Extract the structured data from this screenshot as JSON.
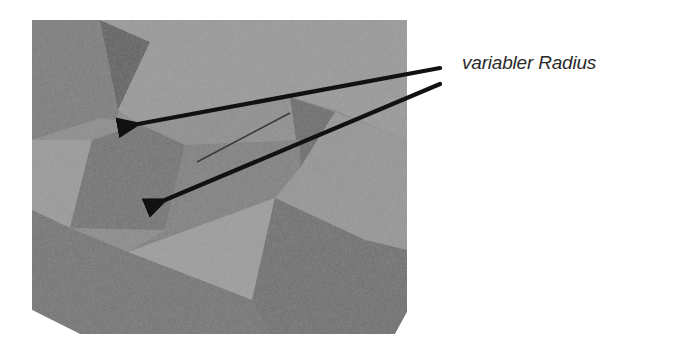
{
  "figure": {
    "type": "3d-render-annotated",
    "background": "#ffffff",
    "render_region": {
      "outline": [
        [
          32,
          20
        ],
        [
          407,
          20
        ],
        [
          407,
          312
        ],
        [
          395,
          334
        ],
        [
          80,
          334
        ],
        [
          32,
          310
        ]
      ],
      "base_color": "#8a8a8a"
    },
    "faces": [
      {
        "name": "top-left-box-face",
        "points": [
          [
            32,
            20
          ],
          [
            100,
            20
          ],
          [
            150,
            42
          ],
          [
            115,
            120
          ],
          [
            32,
            140
          ]
        ],
        "color": "#7c7c7c"
      },
      {
        "name": "top-left-dark-triangle",
        "points": [
          [
            100,
            20
          ],
          [
            150,
            42
          ],
          [
            118,
            110
          ]
        ],
        "color": "#5f5f5f"
      },
      {
        "name": "top-right-light-region",
        "points": [
          [
            100,
            20
          ],
          [
            407,
            20
          ],
          [
            407,
            140
          ],
          [
            335,
            110
          ],
          [
            290,
            97
          ],
          [
            140,
            124
          ],
          [
            118,
            110
          ],
          [
            150,
            42
          ]
        ],
        "color": "#999999"
      },
      {
        "name": "left-light-face",
        "points": [
          [
            32,
            140
          ],
          [
            92,
            140
          ],
          [
            70,
            228
          ],
          [
            32,
            210
          ]
        ],
        "color": "#9a9a9a"
      },
      {
        "name": "left-mid-face",
        "points": [
          [
            32,
            140
          ],
          [
            100,
            118
          ],
          [
            140,
            124
          ],
          [
            92,
            140
          ]
        ],
        "color": "#8c8c8c"
      },
      {
        "name": "center-dark-box-front",
        "points": [
          [
            92,
            140
          ],
          [
            140,
            124
          ],
          [
            185,
            145
          ],
          [
            165,
            230
          ],
          [
            70,
            228
          ]
        ],
        "color": "#727272"
      },
      {
        "name": "center-box-top",
        "points": [
          [
            140,
            124
          ],
          [
            290,
            97
          ],
          [
            300,
            140
          ],
          [
            185,
            145
          ]
        ],
        "color": "#8e8e8e"
      },
      {
        "name": "right-small-dark-triangle",
        "points": [
          [
            290,
            97
          ],
          [
            335,
            112
          ],
          [
            300,
            168
          ]
        ],
        "color": "#6a6a6a"
      },
      {
        "name": "center-right-face",
        "points": [
          [
            185,
            145
          ],
          [
            300,
            140
          ],
          [
            300,
            168
          ],
          [
            275,
            198
          ],
          [
            128,
            252
          ],
          [
            165,
            230
          ]
        ],
        "color": "#808080"
      },
      {
        "name": "right-light-face",
        "points": [
          [
            300,
            168
          ],
          [
            335,
            112
          ],
          [
            407,
            140
          ],
          [
            407,
            250
          ],
          [
            365,
            240
          ],
          [
            275,
            198
          ]
        ],
        "color": "#959595"
      },
      {
        "name": "bottom-light-face",
        "points": [
          [
            128,
            252
          ],
          [
            275,
            198
          ],
          [
            252,
            300
          ]
        ],
        "color": "#9c9c9c"
      },
      {
        "name": "bottom-right-dark-face",
        "points": [
          [
            275,
            198
          ],
          [
            365,
            240
          ],
          [
            407,
            250
          ],
          [
            407,
            312
          ],
          [
            395,
            334
          ],
          [
            270,
            334
          ],
          [
            252,
            300
          ]
        ],
        "color": "#6e6e6e"
      },
      {
        "name": "bottom-base-face",
        "points": [
          [
            32,
            210
          ],
          [
            70,
            228
          ],
          [
            128,
            252
          ],
          [
            252,
            300
          ],
          [
            270,
            334
          ],
          [
            80,
            334
          ],
          [
            32,
            310
          ]
        ],
        "color": "#737373"
      }
    ],
    "annotation": {
      "label": "variabler Radius",
      "label_color": "#2b2b2b",
      "arrow_color": "#111111",
      "arrows": [
        {
          "name": "arrow-upper",
          "from": [
            440,
            68
          ],
          "to": [
            138,
            124
          ]
        },
        {
          "name": "arrow-lower",
          "from": [
            440,
            84
          ],
          "to": [
            165,
            200
          ]
        }
      ],
      "guide_line": {
        "from": [
          290,
          113
        ],
        "to": [
          197,
          162
        ],
        "color": "#3a3a3a"
      }
    }
  }
}
